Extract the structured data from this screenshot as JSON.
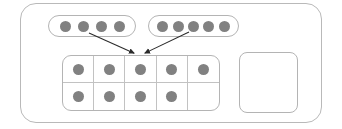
{
  "diagram": {
    "type": "math-manipulative",
    "colors": {
      "counter_fill": "#818181",
      "outline": "#b4b4b4",
      "container_outline": "#b9b9b9",
      "grid_divider": "#c2c2c2",
      "arrow": "#2b2b2b",
      "background": "#ffffff"
    },
    "outer_container": {
      "shape": "rounded-rectangle",
      "label": ""
    },
    "groups": [
      {
        "name": "left-group",
        "shape": "pill",
        "counter_count": 4,
        "counters": [
          "counter",
          "counter",
          "counter",
          "counter"
        ],
        "label": ""
      },
      {
        "name": "right-group",
        "shape": "pill",
        "counter_count": 5,
        "counters": [
          "counter",
          "counter",
          "counter",
          "counter",
          "counter"
        ],
        "label": ""
      }
    ],
    "ten_frame": {
      "name": "ten-frame",
      "columns": 5,
      "rows": 2,
      "total_cells": 10,
      "filled_count": 9,
      "empty_count": 1,
      "cells": [
        {
          "row": 0,
          "col": 0,
          "filled": true
        },
        {
          "row": 0,
          "col": 1,
          "filled": true
        },
        {
          "row": 0,
          "col": 2,
          "filled": true
        },
        {
          "row": 0,
          "col": 3,
          "filled": true
        },
        {
          "row": 0,
          "col": 4,
          "filled": true
        },
        {
          "row": 1,
          "col": 0,
          "filled": true
        },
        {
          "row": 1,
          "col": 1,
          "filled": true
        },
        {
          "row": 1,
          "col": 2,
          "filled": true
        },
        {
          "row": 1,
          "col": 3,
          "filled": true
        },
        {
          "row": 1,
          "col": 4,
          "filled": false
        }
      ]
    },
    "empty_frame": {
      "name": "empty-frame",
      "shape": "rounded-square",
      "counter_count": 0,
      "label": ""
    },
    "arrows": [
      {
        "name": "arrow-from-left-group",
        "from": {
          "x": 89,
          "y": 33
        },
        "to": {
          "x": 136,
          "y": 54
        },
        "direction": "down-right"
      },
      {
        "name": "arrow-from-right-group",
        "from": {
          "x": 189,
          "y": 32
        },
        "to": {
          "x": 143,
          "y": 54
        },
        "direction": "down-left"
      }
    ]
  }
}
